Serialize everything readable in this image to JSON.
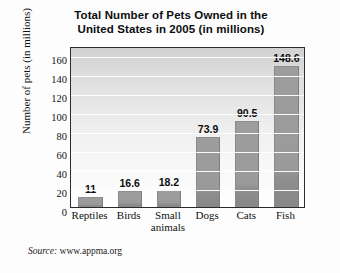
{
  "chart_data": {
    "type": "bar",
    "title": "Total Number of Pets Owned in the United States in 2005 (in millions)",
    "title_lines": [
      "Total Number of Pets Owned in the",
      "United States in 2005 (in millions)"
    ],
    "categories": [
      "Reptiles",
      "Birds",
      "Small animals",
      "Dogs",
      "Cats",
      "Fish"
    ],
    "category_lines": [
      [
        "Reptiles"
      ],
      [
        "Birds"
      ],
      [
        "Small",
        "animals"
      ],
      [
        "Dogs"
      ],
      [
        "Cats"
      ],
      [
        "Fish"
      ]
    ],
    "values": [
      11,
      16.6,
      18.2,
      73.9,
      90.5,
      148.6
    ],
    "value_labels": [
      "11",
      "16.6",
      "18.2",
      "73.9",
      "90.5",
      "148.6"
    ],
    "xlabel": "",
    "ylabel": "Number of pets (in millions)",
    "ylim": [
      0,
      170
    ],
    "yticks": [
      0,
      20,
      40,
      60,
      80,
      100,
      120,
      140,
      160
    ],
    "ytick_labels": [
      "0",
      "20",
      "40",
      "60",
      "80",
      "100",
      "120",
      "140",
      "160"
    ],
    "grid": true,
    "grid_axis": "y",
    "legend": false,
    "bar_color": "#9a9a9a",
    "plot_border_color": "#2b2b2b",
    "gridline_color": "#ffffff"
  },
  "source": {
    "label": "Source:",
    "value": "www.appma.org"
  }
}
